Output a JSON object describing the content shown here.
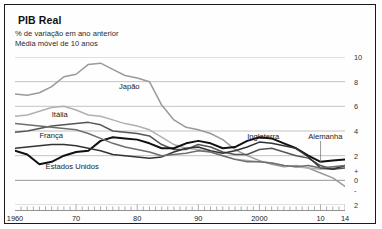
{
  "header": {
    "title": "PIB Real",
    "subtitle1": "% de variação em ano anterior",
    "subtitle2": "Média móvel de 10 anos"
  },
  "chart_data": {
    "type": "line",
    "title": "PIB Real",
    "subtitle": "% de variação em ano anterior; Média móvel de 10 anos",
    "xlabel": "",
    "ylabel": "%",
    "xlim": [
      1960,
      2014
    ],
    "ylim": [
      -2,
      10
    ],
    "grid": true,
    "legend_position": "inline-annotations",
    "y_ticks": [
      "10",
      "8",
      "6",
      "4",
      "2",
      "+",
      "0",
      "-",
      "2"
    ],
    "y_tick_values": [
      10,
      8,
      6,
      4,
      2,
      0.8,
      0,
      -0.8,
      -2
    ],
    "x_ticks": [
      "1960",
      "70",
      "80",
      "90",
      "2000",
      "10",
      "14"
    ],
    "x_tick_values": [
      1960,
      1970,
      1980,
      1990,
      2000,
      2010,
      2014
    ],
    "x": [
      1960,
      1962,
      1964,
      1966,
      1968,
      1970,
      1972,
      1974,
      1976,
      1978,
      1980,
      1982,
      1984,
      1986,
      1988,
      1990,
      1992,
      1994,
      1996,
      1998,
      2000,
      2002,
      2004,
      2006,
      2008,
      2010,
      2012,
      2014
    ],
    "series": [
      {
        "name": "Japão",
        "color": "#9a9a9a",
        "width": 1.5,
        "label_x": 1977,
        "label_y": 7.6,
        "values": [
          7.0,
          6.9,
          7.1,
          7.6,
          8.4,
          8.6,
          9.4,
          9.5,
          9.0,
          8.5,
          8.3,
          8.0,
          6.1,
          4.9,
          4.3,
          4.1,
          3.8,
          3.3,
          2.5,
          2.0,
          1.6,
          1.3,
          1.1,
          1.2,
          1.0,
          0.6,
          0.2,
          -0.5
        ]
      },
      {
        "name": "Itália",
        "color": "#b0b0b0",
        "width": 1.5,
        "label_x": 1966,
        "label_y": 5.3,
        "values": [
          5.2,
          5.3,
          5.6,
          5.9,
          6.0,
          5.7,
          5.3,
          5.2,
          4.9,
          4.6,
          4.4,
          4.1,
          3.5,
          2.9,
          2.6,
          2.5,
          2.3,
          2.0,
          1.7,
          1.6,
          1.5,
          1.4,
          1.2,
          1.1,
          1.0,
          0.9,
          1.0,
          1.1
        ]
      },
      {
        "name": "França",
        "color": "#555555",
        "width": 1.5,
        "label_x": 1964,
        "label_y": 3.6,
        "values": [
          3.9,
          4.0,
          4.2,
          4.4,
          4.5,
          4.6,
          4.7,
          4.5,
          4.0,
          3.9,
          3.8,
          3.6,
          2.9,
          2.5,
          2.5,
          2.9,
          2.7,
          2.3,
          2.1,
          2.1,
          2.5,
          2.6,
          2.3,
          2.0,
          1.8,
          1.2,
          0.9,
          1.0
        ]
      },
      {
        "name": "Estados Unidos",
        "color": "#111111",
        "width": 2.0,
        "label_x": 1965,
        "label_y": 1.1,
        "values": [
          2.4,
          2.1,
          1.3,
          1.5,
          2.0,
          2.3,
          2.4,
          3.2,
          3.5,
          3.4,
          3.3,
          3.0,
          2.6,
          2.6,
          3.0,
          3.2,
          3.0,
          2.6,
          2.7,
          3.2,
          3.5,
          3.4,
          3.0,
          2.6,
          2.0,
          1.5,
          1.6,
          1.7
        ]
      },
      {
        "name": "Inglaterra",
        "color": "#333333",
        "width": 1.5,
        "label_x": 1998,
        "label_y": 3.5,
        "values": [
          2.6,
          2.7,
          2.8,
          2.9,
          2.9,
          2.8,
          2.6,
          2.4,
          2.1,
          2.0,
          1.9,
          1.8,
          1.9,
          2.3,
          2.6,
          2.7,
          2.4,
          2.2,
          2.4,
          2.7,
          3.1,
          3.0,
          2.8,
          2.6,
          1.9,
          1.0,
          0.9,
          1.2
        ]
      },
      {
        "name": "Alemanha",
        "color": "#6e6e6e",
        "width": 1.5,
        "label_x": 2008,
        "label_y": 3.5,
        "values": [
          4.6,
          4.5,
          4.4,
          4.3,
          4.2,
          4.1,
          3.8,
          3.4,
          3.0,
          2.7,
          2.5,
          2.3,
          2.0,
          2.1,
          2.2,
          2.4,
          2.3,
          2.0,
          1.7,
          1.5,
          1.5,
          1.4,
          1.2,
          1.1,
          1.2,
          1.0,
          1.1,
          1.2
        ]
      }
    ],
    "annotations": [
      {
        "text": "Japão",
        "x": 1977,
        "y": 7.6
      },
      {
        "text": "Itália",
        "x": 1966,
        "y": 5.3
      },
      {
        "text": "França",
        "x": 1964,
        "y": 3.6
      },
      {
        "text": "Estados Unidos",
        "x": 1965,
        "y": 1.1
      },
      {
        "text": "Inglaterra",
        "x": 1998,
        "y": 3.5
      },
      {
        "text": "Alemanha",
        "x": 2008,
        "y": 3.5
      }
    ]
  }
}
